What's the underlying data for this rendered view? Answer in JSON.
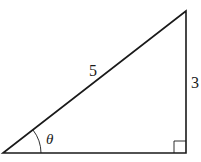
{
  "diagram": {
    "type": "right-triangle",
    "labels": {
      "hypotenuse": "5",
      "opposite": "3",
      "angle": "θ"
    },
    "vertices": {
      "angle_vertex": [
        3,
        153
      ],
      "top_vertex": [
        186,
        11
      ],
      "right_angle_vertex": [
        186,
        153
      ]
    },
    "stroke_color": "#1a1a1a"
  }
}
